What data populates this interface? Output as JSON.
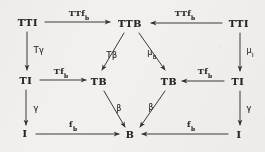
{
  "figure": {
    "kind": "commutative-diagram",
    "background_color": "#f2f1ef",
    "ink_color": "#2a2724",
    "width": 265,
    "height": 152
  },
  "nodes": [
    {
      "id": "tti-left",
      "label": "TTI",
      "x": 28,
      "y": 22
    },
    {
      "id": "ttb",
      "label": "TTB",
      "x": 130,
      "y": 23
    },
    {
      "id": "tti-right",
      "label": "TTI",
      "x": 239,
      "y": 23
    },
    {
      "id": "ti-left",
      "label": "TI",
      "x": 26,
      "y": 80
    },
    {
      "id": "tb-left",
      "label": "TB",
      "x": 99,
      "y": 81
    },
    {
      "id": "tb-right",
      "label": "TB",
      "x": 169,
      "y": 81
    },
    {
      "id": "ti-right",
      "label": "TI",
      "x": 238,
      "y": 81
    },
    {
      "id": "i-left",
      "label": "I",
      "x": 25,
      "y": 133
    },
    {
      "id": "b",
      "label": "B",
      "x": 130,
      "y": 134
    },
    {
      "id": "i-right",
      "label": "I",
      "x": 239,
      "y": 134
    }
  ],
  "edges": [
    {
      "id": "tti-left-to-ttb",
      "from": "tti-left",
      "to": "ttb",
      "label_text": "TTf",
      "label_sub": "b",
      "label_x": 79,
      "label_y": 13,
      "label_style": "roman"
    },
    {
      "id": "tti-right-to-ttb",
      "from": "tti-right",
      "to": "ttb",
      "label_text": "TTf",
      "label_sub": "b",
      "label_x": 185,
      "label_y": 13,
      "label_style": "roman"
    },
    {
      "id": "tti-left-to-ti-left",
      "from": "tti-left",
      "to": "ti-left",
      "label_text": "Tγ",
      "label_sub": "",
      "label_x": 39,
      "label_y": 50,
      "label_style": "greek"
    },
    {
      "id": "tti-right-to-ti-right",
      "from": "tti-right",
      "to": "ti-right",
      "label_text": "μ",
      "label_sub": "I",
      "label_x": 250,
      "label_y": 50,
      "label_style": "greek"
    },
    {
      "id": "ttb-to-tb-left",
      "from": "ttb",
      "to": "tb-left",
      "label_text": "Tβ",
      "label_sub": "",
      "label_x": 112,
      "label_y": 55,
      "label_style": "greek"
    },
    {
      "id": "ttb-to-tb-right",
      "from": "ttb",
      "to": "tb-right",
      "label_text": "μ",
      "label_sub": "B",
      "label_x": 152,
      "label_y": 52,
      "label_style": "greek"
    },
    {
      "id": "ti-left-to-tb-left",
      "from": "ti-left",
      "to": "tb-left",
      "label_text": "Tf",
      "label_sub": "b",
      "label_x": 61,
      "label_y": 71,
      "label_style": "roman"
    },
    {
      "id": "ti-right-to-tb-right",
      "from": "ti-right",
      "to": "tb-right",
      "label_text": "Tf",
      "label_sub": "b",
      "label_x": 205,
      "label_y": 71,
      "label_style": "roman"
    },
    {
      "id": "ti-left-to-i-left",
      "from": "ti-left",
      "to": "i-left",
      "label_text": "γ",
      "label_sub": "",
      "label_x": 36,
      "label_y": 108,
      "label_style": "greek"
    },
    {
      "id": "ti-right-to-i-right",
      "from": "ti-right",
      "to": "i-right",
      "label_text": "γ",
      "label_sub": "",
      "label_x": 249,
      "label_y": 108,
      "label_style": "greek"
    },
    {
      "id": "tb-left-to-b",
      "from": "tb-left",
      "to": "b",
      "label_text": "β",
      "label_sub": "",
      "label_x": 119,
      "label_y": 108,
      "label_style": "greek"
    },
    {
      "id": "tb-right-to-b",
      "from": "tb-right",
      "to": "b",
      "label_text": "β",
      "label_sub": "",
      "label_x": 151,
      "label_y": 107,
      "label_style": "greek"
    },
    {
      "id": "i-left-to-b",
      "from": "i-left",
      "to": "b",
      "label_text": "f",
      "label_sub": "b",
      "label_x": 73,
      "label_y": 124,
      "label_style": "roman"
    },
    {
      "id": "i-right-to-b",
      "from": "i-right",
      "to": "b",
      "label_text": "f",
      "label_sub": "b",
      "label_x": 191,
      "label_y": 124,
      "label_style": "roman"
    }
  ]
}
